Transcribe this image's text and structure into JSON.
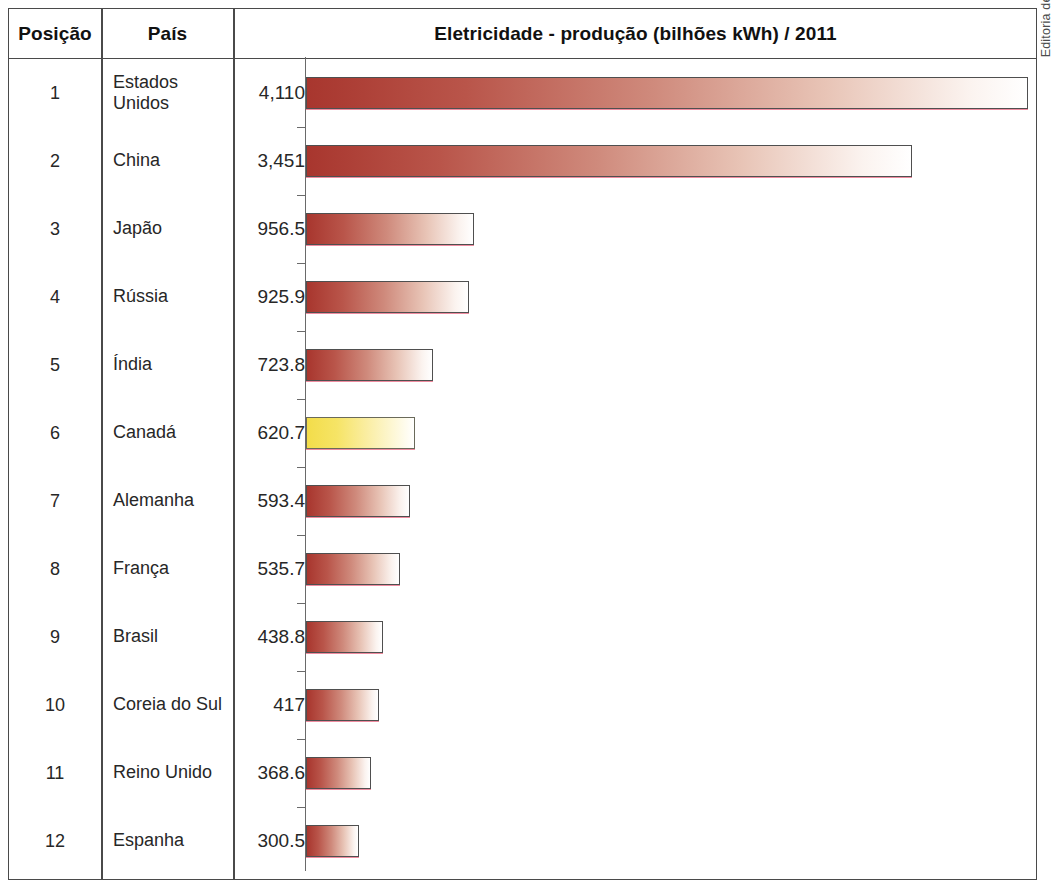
{
  "credit": "Editoria de Arte",
  "header": {
    "position": "Posição",
    "country": "País",
    "chart": "Eletricidade - produção (bilhões kWh) / 2011"
  },
  "chart_data": {
    "type": "bar",
    "title": "Eletricidade - produção (bilhões kWh) / 2011",
    "xlabel": "",
    "ylabel": "",
    "orientation": "horizontal",
    "grid": false,
    "legend": false,
    "xlim": [
      0,
      4110
    ],
    "highlight_category": "Canadá",
    "highlight_color": "#f3dd4a",
    "bar_color": "#a8362e",
    "categories": [
      "Estados Unidos",
      "China",
      "Japão",
      "Rússia",
      "Índia",
      "Canadá",
      "Alemanha",
      "França",
      "Brasil",
      "Coreia do Sul",
      "Reino Unido",
      "Espanha"
    ],
    "values": [
      4110,
      3451,
      956.5,
      925.9,
      723.8,
      620.7,
      593.4,
      535.7,
      438.8,
      417,
      368.6,
      300.5
    ],
    "value_labels": [
      "4,110",
      "3,451",
      "956.5",
      "925.9",
      "723.8",
      "620.7",
      "593.4",
      "535.7",
      "438.8",
      "417",
      "368.6",
      "300.5"
    ],
    "positions": [
      "1",
      "2",
      "3",
      "4",
      "5",
      "6",
      "7",
      "8",
      "9",
      "10",
      "11",
      "12"
    ]
  },
  "rows": [
    {
      "position": "1",
      "country": "Estados\nUnidos",
      "value_label": "4,110",
      "value": 4110,
      "highlight": false
    },
    {
      "position": "2",
      "country": "China",
      "value_label": "3,451",
      "value": 3451,
      "highlight": false
    },
    {
      "position": "3",
      "country": "Japão",
      "value_label": "956.5",
      "value": 956.5,
      "highlight": false
    },
    {
      "position": "4",
      "country": "Rússia",
      "value_label": "925.9",
      "value": 925.9,
      "highlight": false
    },
    {
      "position": "5",
      "country": "Índia",
      "value_label": "723.8",
      "value": 723.8,
      "highlight": false
    },
    {
      "position": "6",
      "country": "Canadá",
      "value_label": "620.7",
      "value": 620.7,
      "highlight": true
    },
    {
      "position": "7",
      "country": "Alemanha",
      "value_label": "593.4",
      "value": 593.4,
      "highlight": false
    },
    {
      "position": "8",
      "country": "França",
      "value_label": "535.7",
      "value": 535.7,
      "highlight": false
    },
    {
      "position": "9",
      "country": "Brasil",
      "value_label": "438.8",
      "value": 438.8,
      "highlight": false
    },
    {
      "position": "10",
      "country": "Coreia do Sul",
      "value_label": "417",
      "value": 417,
      "highlight": false
    },
    {
      "position": "11",
      "country": "Reino Unido",
      "value_label": "368.6",
      "value": 368.6,
      "highlight": false
    },
    {
      "position": "12",
      "country": "Espanha",
      "value_label": "300.5",
      "value": 300.5,
      "highlight": false
    }
  ]
}
